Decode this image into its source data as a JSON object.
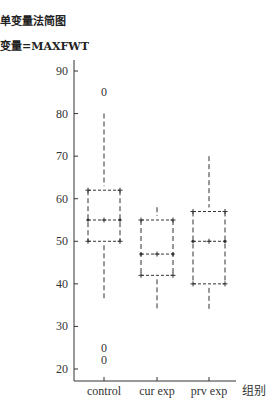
{
  "header": {
    "title": "单变量法简图",
    "subtitle": "变量=MAXFWT"
  },
  "chart_data": {
    "type": "boxplot",
    "title": "单变量法简图",
    "subtitle": "变量=MAXFWT",
    "xlabel": "组别",
    "ylabel": "",
    "ylim": [
      17,
      93
    ],
    "yticks": [
      20,
      30,
      40,
      50,
      60,
      70,
      80,
      90
    ],
    "categories": [
      "control",
      "cur exp",
      "prv exp"
    ],
    "series": [
      {
        "name": "control",
        "whisker_low": 36,
        "q1": 50,
        "median": 55,
        "q3": 62,
        "whisker_high": 80,
        "outliers": [
          85,
          25,
          22
        ]
      },
      {
        "name": "cur exp",
        "whisker_low": 34,
        "q1": 42,
        "median": 47,
        "q3": 55,
        "whisker_high": 58,
        "outliers": []
      },
      {
        "name": "prv exp",
        "whisker_low": 34,
        "q1": 40,
        "median": 50,
        "q3": 57,
        "whisker_high": 70,
        "outliers": []
      }
    ],
    "grid": false,
    "legend": "none",
    "outlier_marker": "0"
  }
}
